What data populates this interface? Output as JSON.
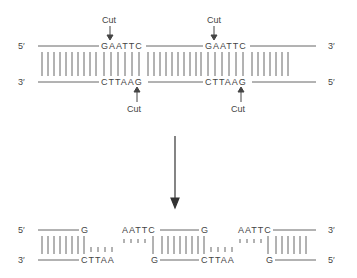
{
  "top": {
    "strand_top_5": "5′",
    "strand_top_3": "3′",
    "strand_bot_3": "3′",
    "strand_bot_5": "5′",
    "site1_top": "GAATTC",
    "site1_bot": "CTTAAG",
    "site2_top": "GAATTC",
    "site2_bot": "CTTAAG",
    "cut_label_1": "Cut",
    "cut_label_2": "Cut",
    "cut_label_3": "Cut",
    "cut_label_4": "Cut"
  },
  "bottom": {
    "strand_top_5": "5′",
    "strand_top_3": "3′",
    "strand_bot_3": "3′",
    "strand_bot_5": "5′",
    "frag1_top": "G",
    "frag1_bot": "CTTAA",
    "frag2_top": "AATTC",
    "frag2_top_end": "G",
    "frag2_bot_start": "G",
    "frag2_bot": "CTTAA",
    "frag3_top": "AATTC",
    "frag3_bot": "G"
  },
  "colors": {
    "line": "#666666",
    "text": "#444444"
  }
}
